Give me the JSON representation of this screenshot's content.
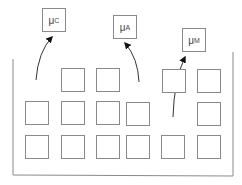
{
  "diagram": {
    "container": {
      "left": 13,
      "right": 233,
      "top_left": 59,
      "top_right": 52,
      "bottom": 175,
      "stroke": "#8a8a8a"
    },
    "labels": [
      {
        "id": "mu-c",
        "symbol": "μ",
        "subscript": "C",
        "x": 42,
        "y": 8
      },
      {
        "id": "mu-a",
        "symbol": "μ",
        "subscript": "A",
        "x": 113,
        "y": 15
      },
      {
        "id": "mu-m",
        "symbol": "μ",
        "subscript": "M",
        "x": 182,
        "y": 28
      }
    ],
    "cells": [
      {
        "x": 61,
        "y": 68
      },
      {
        "x": 96,
        "y": 68
      },
      {
        "x": 162,
        "y": 69
      },
      {
        "x": 197,
        "y": 69
      },
      {
        "x": 25,
        "y": 101
      },
      {
        "x": 61,
        "y": 101
      },
      {
        "x": 96,
        "y": 101
      },
      {
        "x": 126,
        "y": 102
      },
      {
        "x": 197,
        "y": 102
      },
      {
        "x": 25,
        "y": 135
      },
      {
        "x": 61,
        "y": 135
      },
      {
        "x": 96,
        "y": 135
      },
      {
        "x": 126,
        "y": 135
      },
      {
        "x": 161,
        "y": 135
      },
      {
        "x": 197,
        "y": 135
      }
    ],
    "arrows": [
      {
        "id": "arrow-to-mu-c",
        "path": "M36,80 Q38,52 52,37"
      },
      {
        "id": "arrow-to-mu-a",
        "path": "M139,82 Q138,58 125,43"
      },
      {
        "id": "arrow-to-mu-m",
        "path": "M173,117 Q174,80 185,57"
      }
    ]
  }
}
